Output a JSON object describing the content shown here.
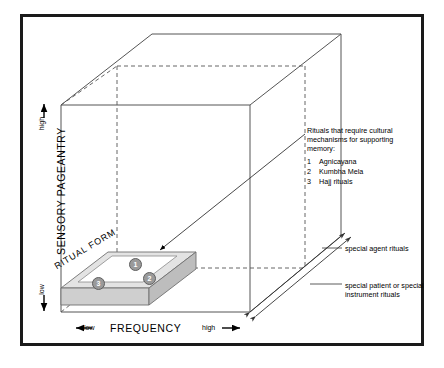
{
  "figure": {
    "axes": {
      "y": {
        "title": "SENSORY PAGEANTRY",
        "high": "high",
        "low": "low"
      },
      "x": {
        "title": "FREQUENCY",
        "low": "low",
        "high": "high"
      }
    },
    "slab": {
      "label": "RITUAL FORM",
      "nodes": [
        {
          "id": "1",
          "label": "1"
        },
        {
          "id": "2",
          "label": "2"
        },
        {
          "id": "3",
          "label": "3"
        }
      ]
    },
    "legend": {
      "line1": "Rituals that require cultural",
      "line2": "mechanisms for supporting",
      "line3": "memory:",
      "items": [
        {
          "num": "1",
          "label": "Agnicayana"
        },
        {
          "num": "2",
          "label": "Kumbha Mela"
        },
        {
          "num": "3",
          "label": "Hajj rituals"
        }
      ]
    },
    "annotations": {
      "agent": "special agent rituals",
      "patient": "special patient or special instrument rituals"
    },
    "colors": {
      "border": "#1a1a1a",
      "slab_top": "#e3e3e3",
      "slab_front": "#cfcfcf",
      "slab_side": "#bdbdbd",
      "node_fill": "#9a9a9a",
      "line": "#555555"
    }
  }
}
